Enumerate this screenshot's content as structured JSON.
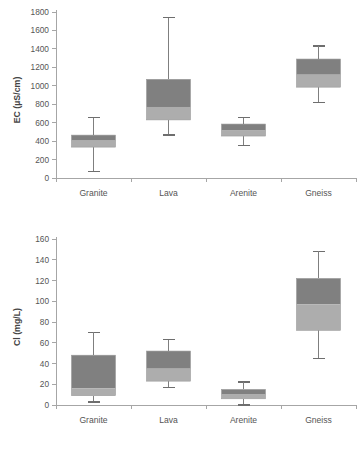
{
  "figure": {
    "background": "#ffffff",
    "box_upper_color": "#808080",
    "box_lower_color": "#adadad",
    "axis_color": "#a6a6a6",
    "whisker_color": "#7f7f7f"
  },
  "chart_data": [
    {
      "type": "box",
      "id": "ec",
      "title": "",
      "xlabel": "",
      "ylabel": "EC (µS/cm)",
      "ylim": [
        0,
        1800
      ],
      "yticks": [
        0,
        200,
        400,
        600,
        800,
        1000,
        1200,
        1400,
        1600,
        1800
      ],
      "ytick_labels": [
        "0",
        "200",
        "400",
        "600",
        "800",
        "1000",
        "1200",
        "1400",
        "1600",
        "1800"
      ],
      "grid": false,
      "legend": "none",
      "categories": [
        "Granite",
        "Lava",
        "Arenite",
        "Gneiss"
      ],
      "boxes": [
        {
          "category": "Granite",
          "whisker_low": 70,
          "q1": 335,
          "median": 405,
          "q3": 465,
          "whisker_high": 655
        },
        {
          "category": "Lava",
          "whisker_low": 465,
          "q1": 630,
          "median": 770,
          "q3": 1070,
          "whisker_high": 1740
        },
        {
          "category": "Arenite",
          "whisker_low": 355,
          "q1": 455,
          "median": 520,
          "q3": 585,
          "whisker_high": 655
        },
        {
          "category": "Gneiss",
          "whisker_low": 820,
          "q1": 985,
          "median": 1120,
          "q3": 1290,
          "whisker_high": 1430
        }
      ]
    },
    {
      "type": "box",
      "id": "cl",
      "title": "",
      "xlabel": "",
      "ylabel": "Cl (mg/L)",
      "ylim": [
        0,
        160
      ],
      "yticks": [
        0,
        20,
        40,
        60,
        80,
        100,
        120,
        140,
        160
      ],
      "ytick_labels": [
        "0",
        "20",
        "40",
        "60",
        "80",
        "100",
        "120",
        "140",
        "160"
      ],
      "grid": false,
      "legend": "none",
      "categories": [
        "Granite",
        "Lava",
        "Arenite",
        "Gneiss"
      ],
      "boxes": [
        {
          "category": "Granite",
          "whisker_low": 3,
          "q1": 9,
          "median": 16,
          "q3": 48,
          "whisker_high": 70
        },
        {
          "category": "Lava",
          "whisker_low": 17,
          "q1": 23,
          "median": 35,
          "q3": 52,
          "whisker_high": 63
        },
        {
          "category": "Arenite",
          "whisker_low": 0,
          "q1": 6,
          "median": 10,
          "q3": 15,
          "whisker_high": 22
        },
        {
          "category": "Gneiss",
          "whisker_low": 45,
          "q1": 72,
          "median": 97,
          "q3": 122,
          "whisker_high": 148
        }
      ]
    }
  ]
}
